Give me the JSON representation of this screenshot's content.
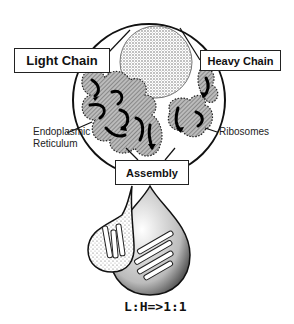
{
  "diagram": {
    "labels": {
      "light_chain": "Light Chain",
      "heavy_chain": "Heavy Chain",
      "assembly": "Assembly",
      "endoplasmic_line1": "Endoplasmic",
      "endoplasmic_line2": "Reticulum",
      "ribosomes": "Ribosomes",
      "ratio": "L:H=>1:1"
    },
    "nodes": [
      {
        "id": "cell",
        "shape": "circle",
        "contains": [
          "nucleus",
          "endoplasmic-reticulum",
          "ribosomes"
        ]
      },
      {
        "id": "light-chain",
        "label": "Light Chain"
      },
      {
        "id": "heavy-chain",
        "label": "Heavy Chain"
      },
      {
        "id": "assembly",
        "label": "Assembly"
      },
      {
        "id": "small-vesicle",
        "shape": "droplet",
        "contains": "light chains"
      },
      {
        "id": "large-vesicle",
        "shape": "droplet",
        "contains": "assembled chains"
      }
    ],
    "colors": {
      "ink": "#111111",
      "stipple": "#888888",
      "background": "#ffffff"
    }
  }
}
